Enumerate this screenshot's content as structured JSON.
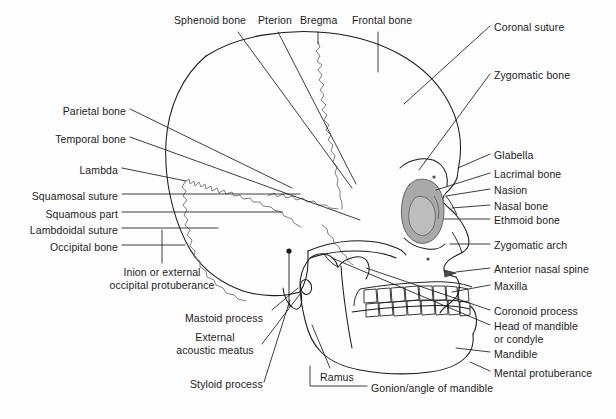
{
  "figure": {
    "background_color": "#fefefe",
    "line_color": "#1b1b1b",
    "suture_color": "#6f6f6f",
    "orbit_fill_color": "#a9a9a9",
    "orbit_inner_fill_color": "#bdbdbd",
    "text_color": "#1b1b1b"
  },
  "labels": {
    "top": [
      {
        "id": "sphenoid-bone",
        "text": "Sphenoid bone",
        "x": 174,
        "y": 20,
        "align": "left"
      },
      {
        "id": "pterion",
        "text": "Pterion",
        "x": 258,
        "y": 20,
        "align": "left"
      },
      {
        "id": "bregma",
        "text": "Bregma",
        "x": 300,
        "y": 20,
        "align": "left"
      },
      {
        "id": "frontal-bone",
        "text": "Frontal bone",
        "x": 352,
        "y": 20,
        "align": "left"
      }
    ],
    "left": [
      {
        "id": "parietal-bone",
        "text": "Parietal bone",
        "x": 57,
        "y": 112,
        "align": "left"
      },
      {
        "id": "temporal-bone",
        "text": "Temporal  bone",
        "x": 40,
        "y": 140,
        "align": "left"
      },
      {
        "id": "lambda",
        "text": "Lambda",
        "x": 78,
        "y": 171,
        "align": "left"
      },
      {
        "id": "squamosal-suture",
        "text": "Squamosal suture",
        "x": 31,
        "y": 197,
        "align": "left"
      },
      {
        "id": "squamous-part",
        "text": "Squamous part",
        "x": 45,
        "y": 215,
        "align": "left"
      },
      {
        "id": "lambdoidal-suture",
        "text": "Lambdoidal suture",
        "x": 27,
        "y": 231,
        "align": "left"
      },
      {
        "id": "occipital-bone",
        "text": "Occipital bone",
        "x": 48,
        "y": 248,
        "align": "left"
      }
    ],
    "left_multiline": [
      {
        "id": "inion",
        "lines": [
          "Inion or external",
          "occipital protuberance"
        ],
        "x": 67,
        "y": 273,
        "align": "center"
      },
      {
        "id": "external-acoustic-meatus",
        "lines": [
          "External",
          "acoustic meatus"
        ],
        "x": 187,
        "y": 339,
        "align": "center"
      }
    ],
    "lower_left": [
      {
        "id": "mastoid-process",
        "text": "Mastoid process",
        "x": 185,
        "y": 318,
        "align": "left"
      },
      {
        "id": "styloid-process",
        "text": "Styloid process",
        "x": 190,
        "y": 385,
        "align": "left"
      }
    ],
    "bottom": [
      {
        "id": "ramus",
        "text": "Ramus",
        "x": 320,
        "y": 378,
        "align": "left"
      },
      {
        "id": "gonion-angle-of-mandible",
        "text": "Gonion/angle of mandible",
        "x": 371,
        "y": 389,
        "align": "left"
      }
    ],
    "right": [
      {
        "id": "coronal-suture",
        "text": "Coronal suture",
        "x": 494,
        "y": 27,
        "align": "left"
      },
      {
        "id": "zygomatic-bone",
        "text": "Zygomatic bone",
        "x": 494,
        "y": 76,
        "align": "left"
      },
      {
        "id": "glabella",
        "text": "Glabella",
        "x": 494,
        "y": 157,
        "align": "left"
      },
      {
        "id": "lacrimal-bone",
        "text": "Lacrimal bone",
        "x": 494,
        "y": 176,
        "align": "left"
      },
      {
        "id": "nasion",
        "text": "Nasion",
        "x": 494,
        "y": 192,
        "align": "left"
      },
      {
        "id": "nasal-bone",
        "text": "Nasal bone",
        "x": 494,
        "y": 208,
        "align": "left"
      },
      {
        "id": "ethmoid-bone",
        "text": "Ethmoid bone",
        "x": 494,
        "y": 222,
        "align": "left"
      },
      {
        "id": "zygomatic-arch",
        "text": "Zygomatic arch",
        "x": 494,
        "y": 247,
        "align": "left"
      },
      {
        "id": "anterior-nasal-spine",
        "text": "Anterior nasal spine",
        "x": 494,
        "y": 271,
        "align": "left"
      },
      {
        "id": "maxilla",
        "text": "Maxilla",
        "x": 494,
        "y": 288,
        "align": "left"
      },
      {
        "id": "coronoid-process",
        "text": "Coronoid  process",
        "x": 494,
        "y": 313,
        "align": "left"
      },
      {
        "id": "mandible",
        "text": "Mandible",
        "x": 494,
        "y": 355,
        "align": "left"
      },
      {
        "id": "mental-protuberance",
        "text": "Mental protuberance",
        "x": 494,
        "y": 374,
        "align": "left"
      }
    ],
    "right_multiline": [
      {
        "id": "head-of-mandible",
        "lines": [
          "Head of mandible",
          "or condyle"
        ],
        "x": 494,
        "y": 328,
        "align": "left"
      }
    ]
  },
  "anatomy": {
    "regions": [
      "cranial-vault",
      "frontal-bone",
      "parietal-bone",
      "temporal-bone",
      "occipital-bone",
      "sphenoid-bone",
      "orbit",
      "nasal-aperture",
      "zygomatic-arch",
      "maxilla",
      "mandible",
      "ramus",
      "teeth"
    ],
    "sutures": [
      "coronal-suture",
      "squamosal-suture",
      "lambdoidal-suture"
    ],
    "landmarks": [
      "bregma",
      "pterion",
      "lambda",
      "nasion",
      "glabella",
      "gonion",
      "inion"
    ],
    "teeth_upper_count": 8,
    "teeth_lower_count": 8
  }
}
